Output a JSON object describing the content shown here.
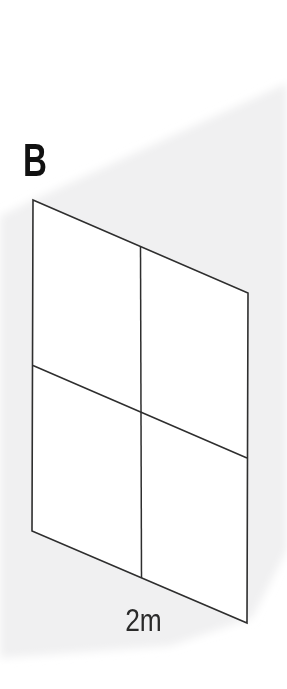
{
  "figure": {
    "label": "B",
    "dimension_label": "2m",
    "grid": {
      "rows": 2,
      "columns": 2
    },
    "colors": {
      "background": "#ffffff",
      "shade": "#f0f0f1",
      "line": "#2e2e2e",
      "label_text": "#111111",
      "dimension_text": "#2a2a2a"
    },
    "paths": {
      "shade": "M287,83 L33,200 L0,216 L0,658 L170,646 L252,618 L287,550 Z",
      "outline": "M33,200 L248,293 L247,623 L32,531 Z",
      "vertical_divider": "M140.5,246.5 L141.5,578",
      "horizontal_divider": "M33,365.5 L247,458"
    }
  }
}
